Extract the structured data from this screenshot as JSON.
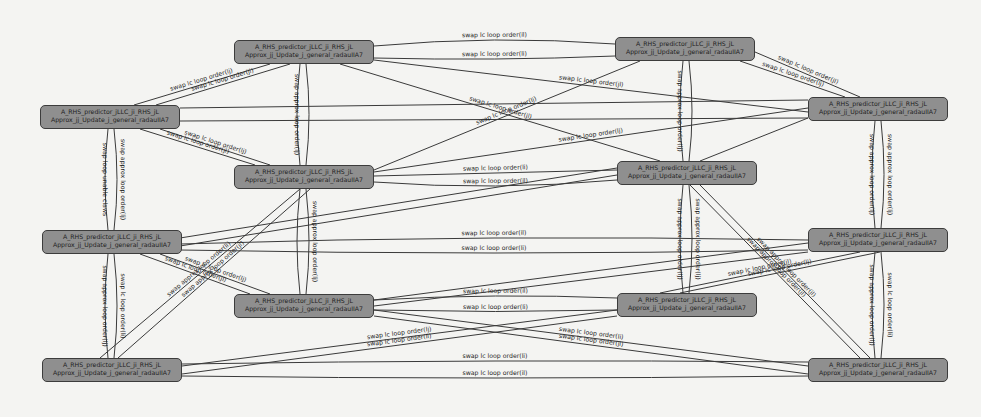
{
  "diagram": {
    "node_label_line1": "A_RHS_predictor_jLLC_ji_RHS_jL",
    "node_label_line2": "Approx_jj_Update_j_general_radauIIA7",
    "nodes": [
      {
        "id": "n0",
        "x": 234,
        "y": 40,
        "w": 140,
        "h": 24
      },
      {
        "id": "n1",
        "x": 615,
        "y": 37,
        "w": 140,
        "h": 24
      },
      {
        "id": "n2",
        "x": 40,
        "y": 105,
        "w": 140,
        "h": 24
      },
      {
        "id": "n3",
        "x": 808,
        "y": 97,
        "w": 140,
        "h": 24
      },
      {
        "id": "n4",
        "x": 234,
        "y": 165,
        "w": 140,
        "h": 24
      },
      {
        "id": "n5",
        "x": 617,
        "y": 161,
        "w": 140,
        "h": 24
      },
      {
        "id": "n6",
        "x": 42,
        "y": 230,
        "w": 140,
        "h": 24
      },
      {
        "id": "n7",
        "x": 808,
        "y": 228,
        "w": 140,
        "h": 24
      },
      {
        "id": "n8",
        "x": 234,
        "y": 294,
        "w": 140,
        "h": 24
      },
      {
        "id": "n9",
        "x": 617,
        "y": 293,
        "w": 140,
        "h": 24
      },
      {
        "id": "n10",
        "x": 42,
        "y": 358,
        "w": 140,
        "h": 24
      },
      {
        "id": "n11",
        "x": 808,
        "y": 358,
        "w": 140,
        "h": 24
      }
    ],
    "edges": [
      {
        "x1": 374,
        "y1": 46,
        "x2": 615,
        "y2": 44,
        "curve": -10,
        "label": "swap lc loop order(il)"
      },
      {
        "x1": 374,
        "y1": 58,
        "x2": 615,
        "y2": 56,
        "curve": 4,
        "label": "swap lc loop order(li)"
      },
      {
        "x1": 134,
        "y1": 105,
        "x2": 270,
        "y2": 64,
        "curve": 0,
        "label": "swap lc loop order(lj)"
      },
      {
        "x1": 156,
        "y1": 105,
        "x2": 290,
        "y2": 64,
        "curve": 0,
        "label": "swap lc loop order(jl)"
      },
      {
        "x1": 755,
        "y1": 52,
        "x2": 860,
        "y2": 97,
        "curve": 0,
        "label": "swap lc loop order(jl)"
      },
      {
        "x1": 740,
        "y1": 61,
        "x2": 845,
        "y2": 97,
        "curve": 0,
        "label": "swap lc loop order(lj)"
      },
      {
        "x1": 180,
        "y1": 108,
        "x2": 808,
        "y2": 100,
        "curve": 0,
        "label": ""
      },
      {
        "x1": 180,
        "y1": 121,
        "x2": 808,
        "y2": 118,
        "curve": 0,
        "label": ""
      },
      {
        "x1": 374,
        "y1": 60,
        "x2": 808,
        "y2": 112,
        "curve": 0,
        "label": "swap lc loop order(jl)"
      },
      {
        "x1": 374,
        "y1": 170,
        "x2": 640,
        "y2": 61,
        "curve": 0,
        "label": "swap lc loop order(lj)"
      },
      {
        "x1": 340,
        "y1": 64,
        "x2": 660,
        "y2": 161,
        "curve": 0,
        "label": "swap lc loop order(jl)"
      },
      {
        "x1": 160,
        "y1": 129,
        "x2": 270,
        "y2": 165,
        "curve": 0,
        "label": "swap lc loop order(lj)"
      },
      {
        "x1": 140,
        "y1": 129,
        "x2": 255,
        "y2": 165,
        "curve": 0,
        "label": "swap lc loop order(jl)"
      },
      {
        "x1": 374,
        "y1": 176,
        "x2": 617,
        "y2": 170,
        "curve": 0,
        "label": "swap lc loop order(li)"
      },
      {
        "x1": 374,
        "y1": 182,
        "x2": 617,
        "y2": 180,
        "curve": 10,
        "label": "swap lc loop order(il)"
      },
      {
        "x1": 374,
        "y1": 172,
        "x2": 808,
        "y2": 108,
        "curve": 0,
        "label": "swap lc loop order(lj)"
      },
      {
        "x1": 700,
        "y1": 161,
        "x2": 808,
        "y2": 118,
        "curve": 0,
        "label": ""
      },
      {
        "x1": 180,
        "y1": 238,
        "x2": 617,
        "y2": 168,
        "curve": 0,
        "label": ""
      },
      {
        "x1": 180,
        "y1": 244,
        "x2": 808,
        "y2": 240,
        "curve": -8,
        "label": "swap lc loop order(il)"
      },
      {
        "x1": 180,
        "y1": 250,
        "x2": 808,
        "y2": 250,
        "curve": 6,
        "label": "swap lc loop order(li)"
      },
      {
        "x1": 180,
        "y1": 246,
        "x2": 617,
        "y2": 175,
        "curve": 0,
        "label": ""
      },
      {
        "x1": 160,
        "y1": 254,
        "x2": 270,
        "y2": 294,
        "curve": 0,
        "label": "swap lc loop order(lj)"
      },
      {
        "x1": 140,
        "y1": 254,
        "x2": 250,
        "y2": 294,
        "curve": 0,
        "label": "swap lc loop order(jl)"
      },
      {
        "x1": 374,
        "y1": 300,
        "x2": 617,
        "y2": 298,
        "curve": -6,
        "label": "swap lc loop order(il)"
      },
      {
        "x1": 374,
        "y1": 310,
        "x2": 617,
        "y2": 310,
        "curve": 3,
        "label": "swap lc loop order(li)"
      },
      {
        "x1": 374,
        "y1": 300,
        "x2": 808,
        "y2": 243,
        "curve": 0,
        "label": ""
      },
      {
        "x1": 374,
        "y1": 306,
        "x2": 808,
        "y2": 252,
        "curve": 0,
        "label": ""
      },
      {
        "x1": 660,
        "y1": 293,
        "x2": 860,
        "y2": 252,
        "curve": 0,
        "label": "swap lc loop order(jl)"
      },
      {
        "x1": 680,
        "y1": 293,
        "x2": 880,
        "y2": 252,
        "curve": 0,
        "label": "swap lc loop order(lj)"
      },
      {
        "x1": 374,
        "y1": 310,
        "x2": 808,
        "y2": 366,
        "curve": 0,
        "label": "swap lc loop order(li)"
      },
      {
        "x1": 374,
        "y1": 316,
        "x2": 808,
        "y2": 374,
        "curve": 0,
        "label": "swap lc loop order(jl)"
      },
      {
        "x1": 617,
        "y1": 310,
        "x2": 182,
        "y2": 366,
        "curve": 0,
        "label": "swap lc loop order(lj)"
      },
      {
        "x1": 617,
        "y1": 316,
        "x2": 182,
        "y2": 374,
        "curve": 0,
        "label": "swap lc loop order(li)"
      },
      {
        "x1": 182,
        "y1": 364,
        "x2": 808,
        "y2": 362,
        "curve": -4,
        "label": "swap lc loop order(li)"
      },
      {
        "x1": 182,
        "y1": 376,
        "x2": 808,
        "y2": 376,
        "curve": 4,
        "label": "swap lc loop order(il)"
      },
      {
        "x1": 100,
        "y1": 358,
        "x2": 300,
        "y2": 189,
        "curve": 0,
        "label": "swap approx loop order(li)"
      },
      {
        "x1": 118,
        "y1": 358,
        "x2": 310,
        "y2": 189,
        "curve": 0,
        "label": "swap approx loop order(jl)"
      },
      {
        "x1": 700,
        "y1": 185,
        "x2": 870,
        "y2": 358,
        "curve": 0,
        "label": "swap approx loop order(jl)"
      },
      {
        "x1": 690,
        "y1": 185,
        "x2": 860,
        "y2": 358,
        "curve": 0,
        "label": "swap approx loop order(jl)"
      }
    ],
    "vertical_edges": [
      {
        "x": 108,
        "y1": 129,
        "y2": 230,
        "bow": -3,
        "label": "swap loop unable claws",
        "side": "left"
      },
      {
        "x": 114,
        "y1": 129,
        "y2": 230,
        "bow": 3,
        "label": "swap approx loop order(lj)",
        "side": "right"
      },
      {
        "x": 108,
        "y1": 254,
        "y2": 358,
        "bow": -3,
        "label": "swap approx loop order(lj)",
        "side": "left"
      },
      {
        "x": 114,
        "y1": 254,
        "y2": 358,
        "bow": 3,
        "label": "swap lc loop order(li)",
        "side": "right"
      },
      {
        "x": 300,
        "y1": 64,
        "y2": 165,
        "bow": -3,
        "label": "swap approx loop order(lj)",
        "side": "left"
      },
      {
        "x": 306,
        "y1": 64,
        "y2": 165,
        "bow": 3,
        "label": "",
        "side": "right"
      },
      {
        "x": 300,
        "y1": 189,
        "y2": 294,
        "bow": -3,
        "label": "",
        "side": "left"
      },
      {
        "x": 306,
        "y1": 189,
        "y2": 294,
        "bow": 3,
        "label": "swap approx loop order(lj)",
        "side": "right"
      },
      {
        "x": 683,
        "y1": 61,
        "y2": 161,
        "bow": -3,
        "label": "swap approx loop order(lj)",
        "side": "left"
      },
      {
        "x": 689,
        "y1": 61,
        "y2": 161,
        "bow": 3,
        "label": "",
        "side": "right"
      },
      {
        "x": 683,
        "y1": 185,
        "y2": 293,
        "bow": -3,
        "label": "swap approx loop order(lj)",
        "side": "left"
      },
      {
        "x": 689,
        "y1": 185,
        "y2": 293,
        "bow": 3,
        "label": "swap approx loop order(lj)",
        "side": "right"
      },
      {
        "x": 875,
        "y1": 121,
        "y2": 228,
        "bow": -3,
        "label": "swap approx loop order(lj)",
        "side": "left"
      },
      {
        "x": 881,
        "y1": 121,
        "y2": 228,
        "bow": 3,
        "label": "swap approx loop order(lj)",
        "side": "right"
      },
      {
        "x": 875,
        "y1": 252,
        "y2": 358,
        "bow": -3,
        "label": "swap approx loop order(lj)",
        "side": "left"
      },
      {
        "x": 881,
        "y1": 252,
        "y2": 358,
        "bow": 3,
        "label": "swap lc loop order(li)",
        "side": "right"
      }
    ],
    "colors": {
      "background": "#f4f4f2",
      "node_fill": "#8f8f8f",
      "node_border": "#3c3c3c",
      "edge": "#3a3a3a",
      "text": "#1e1e1e"
    }
  }
}
